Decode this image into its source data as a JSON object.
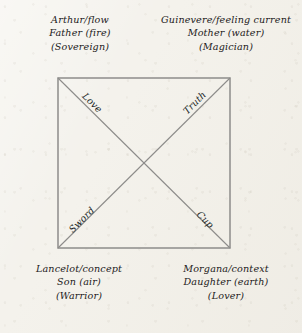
{
  "figure": {
    "name": "four-fold-square-diagram",
    "background_color": "#f4f2ec",
    "line_color": "#8d8c8a",
    "text_color": "#232021",
    "square": {
      "left": 58,
      "top": 78,
      "right": 230,
      "bottom": 248
    },
    "center": {
      "x": 144,
      "y": 163
    }
  },
  "corners": {
    "top_left": {
      "line1": "Arthur/flow",
      "line2": "Father (fire)",
      "line3": "(Sovereign)"
    },
    "top_right": {
      "line1": "Guinevere/feeling current",
      "line2": "Mother (water)",
      "line3": "(Magician)"
    },
    "bottom_left": {
      "line1": "Lancelot/concept",
      "line2": "Son (air)",
      "line3": "(Warrior)"
    },
    "bottom_right": {
      "line1": "Morgana/context",
      "line2": "Daughter (earth)",
      "line3": "(Lover)"
    }
  },
  "diagonals": {
    "upper_left": "Love",
    "upper_right": "Truth",
    "lower_left": "Sword",
    "lower_right": "Cup"
  }
}
